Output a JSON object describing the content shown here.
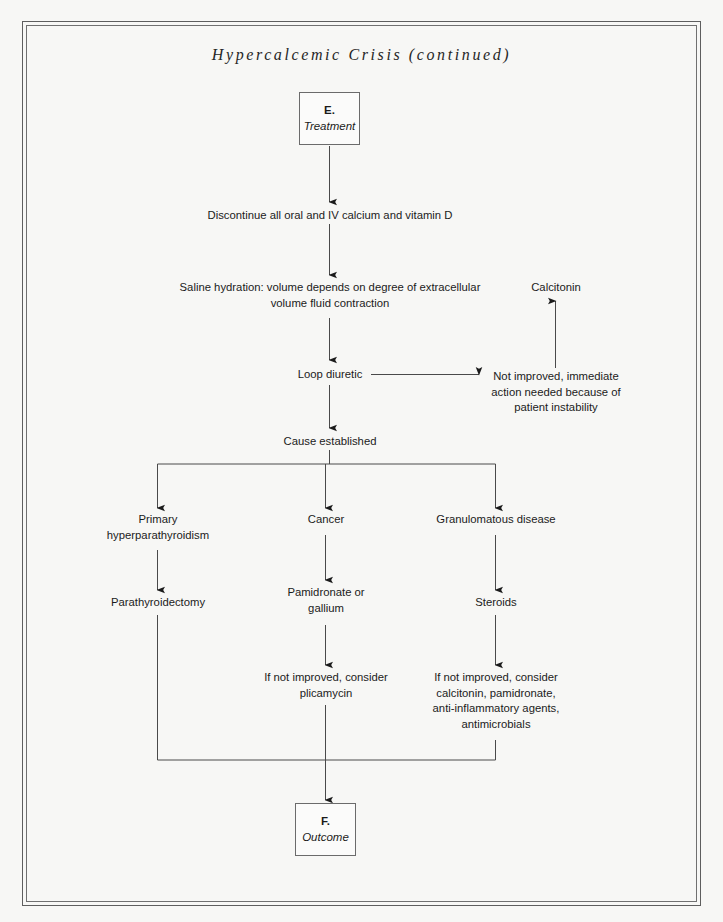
{
  "page": {
    "title": "Hypercalcemic Crisis (continued)",
    "background_color": "#f7f7f5",
    "border_color": "#5e5e5e",
    "line_color": "#4a4a4a",
    "text_color": "#1b1b1b"
  },
  "flow": {
    "start_box": {
      "letter": "E.",
      "caption": "Treatment"
    },
    "end_box": {
      "letter": "F.",
      "caption": "Outcome"
    },
    "steps": {
      "discontinue": "Discontinue all oral and IV calcium and vitamin D",
      "saline": "Saline hydration: volume depends on degree of extracellular\nvolume fluid contraction",
      "loop_diuretic": "Loop diuretic",
      "not_improved": "Not improved, immediate\naction needed because of\npatient instability",
      "calcitonin": "Calcitonin",
      "cause_established": "Cause established"
    },
    "branches": [
      {
        "cause": "Primary\nhyperparathyroidism",
        "treatment": "Parathyroidectomy",
        "followup": ""
      },
      {
        "cause": "Cancer",
        "treatment": "Pamidronate or\ngallium",
        "followup": "If not improved, consider\nplicamycin"
      },
      {
        "cause": "Granulomatous disease",
        "treatment": "Steroids",
        "followup": "If not improved, consider\ncalcitonin, pamidronate,\nanti-inflammatory agents,\nantimicrobials"
      }
    ]
  }
}
